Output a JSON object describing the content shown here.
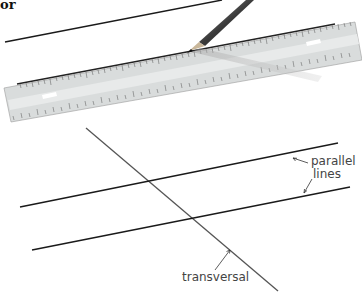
{
  "heading": {
    "text": "or"
  },
  "labels": {
    "parallel_lines": [
      "parallel",
      "lines"
    ],
    "transversal": "transversal"
  },
  "colors": {
    "line": "#1a1a1a",
    "transversal_line": "#555555",
    "ruler_body": "#d9dcdc",
    "ruler_edge": "#222222",
    "pencil": "#3a3a3a",
    "label_text": "#444444"
  },
  "figure": {
    "top": "Drawing a line with a ruler and pencil",
    "bottom": "Two parallel lines cut by a transversal"
  }
}
